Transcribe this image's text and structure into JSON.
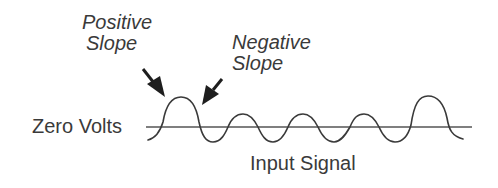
{
  "diagram": {
    "labels": {
      "positive_slope_line1": "Positive",
      "positive_slope_line2": "Slope",
      "negative_slope_line1": "Negative",
      "negative_slope_line2": "Slope",
      "zero_volts": "Zero Volts",
      "input_signal": "Input Signal"
    },
    "colors": {
      "stroke": "#3a3a3a",
      "arrow": "#1e1e1e",
      "background": "#ffffff"
    }
  }
}
